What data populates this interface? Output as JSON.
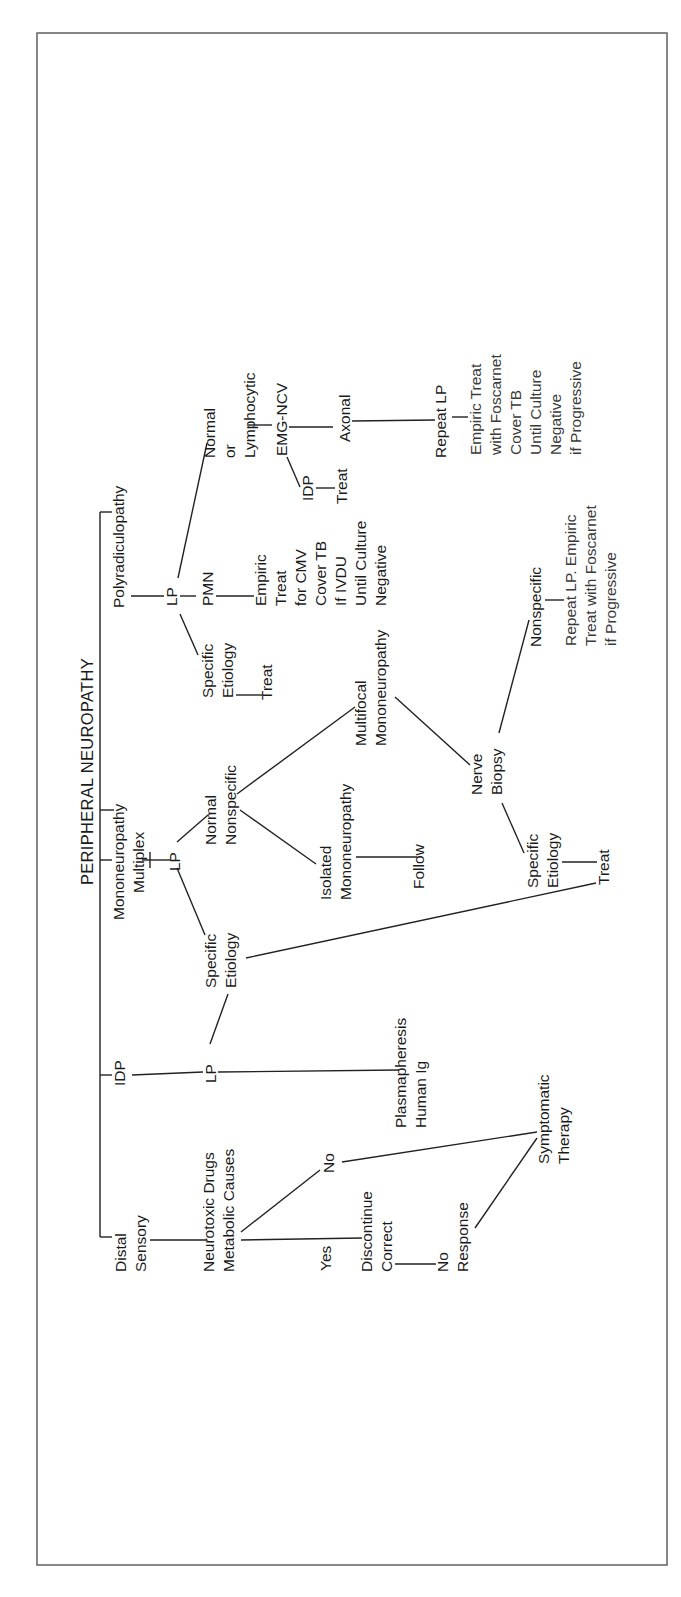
{
  "title": "PERIPHERAL NEUROPATHY",
  "colors": {
    "line": "#222222",
    "text": "#1a1a1a",
    "frame": "#6a6a6a",
    "background": "#ffffff"
  },
  "orientation": "rotated 90° counter-clockwise (text reads bottom-to-top)",
  "branches": {
    "distal_sensory": {
      "label": [
        "Distal",
        "Sensory"
      ],
      "next": [
        "Neurotoxic Drugs",
        "Metabolic Causes"
      ],
      "yes": "Yes",
      "no": "No",
      "discontinue": [
        "Discontinue",
        "Correct"
      ],
      "no_response": [
        "No",
        "Response"
      ],
      "symptomatic": [
        "Symptomatic",
        "Therapy"
      ]
    },
    "idp": {
      "label": "IDP",
      "lp": "LP",
      "plasma": [
        "Plasmapheresis",
        "Human Ig"
      ]
    },
    "mononeuropathy": {
      "label": [
        "Mononeuropathy",
        "Multiplex"
      ],
      "lp": "LP",
      "specific": [
        "Specific",
        "Etiology"
      ],
      "normal": [
        "Normal",
        "Nonspecific"
      ],
      "isolated": [
        "Isolated",
        "Mononeuropathy"
      ],
      "follow": "Follow",
      "multifocal": [
        "Multifocal",
        "Mononeuropathy"
      ],
      "nerve_biopsy": [
        "Nerve",
        "Biopsy"
      ],
      "biopsy_specific": [
        "Specific",
        "Etiology"
      ],
      "treat": "Treat",
      "biopsy_nonspecific": "Nonspecific",
      "repeat_lp_empiric": [
        "Repeat LP. Empiric",
        "Treat with Foscarnet",
        "if Progressive"
      ]
    },
    "polyradiculopathy": {
      "label": "Polyradiculopathy",
      "lp": "LP",
      "specific": [
        "Specific",
        "Etiology"
      ],
      "specific_treat": "Treat",
      "pmn": "PMN",
      "empiric_cmv": [
        "Empiric",
        "Treat",
        "for CMV",
        "Cover TB",
        "If IVDU",
        "Until Culture",
        "Negative"
      ],
      "normal_lymph": [
        "Normal",
        "or",
        "Lymphocytic"
      ],
      "emg": "EMG-NCV",
      "idp": "IDP",
      "idp_treat": "Treat",
      "axonal": "Axonal",
      "repeat_lp": "Repeat LP",
      "empiric_foscarnet": [
        "Empiric Treat",
        "with Foscarnet",
        "Cover TB",
        "Until Culture",
        "Negative",
        "if Progressive"
      ]
    }
  }
}
